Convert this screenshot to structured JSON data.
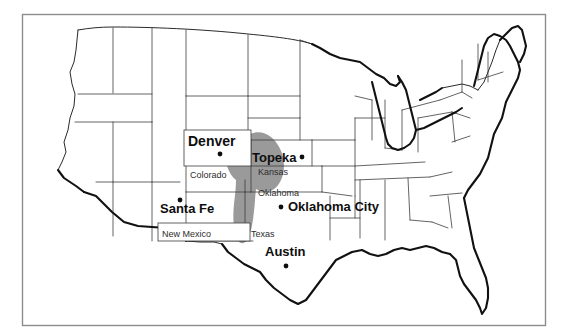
{
  "figure": {
    "name": "united-states-map",
    "background_color": "#ffffff",
    "frame_color": "#8d8d8d",
    "state_border_color": "#3c3c3c",
    "coastline_color": "#111111",
    "shaded_region_color": "#9a9a9a"
  },
  "shaded_region": {
    "label": "shaded-area",
    "color": "#9a9a9a",
    "covers": "southeastern Colorado, southwestern Kansas, Oklahoma panhandle, northern Texas panhandle"
  },
  "cities": [
    {
      "name": "Denver",
      "dot_position": "below-label"
    },
    {
      "name": "Topeka",
      "dot_position": "right-of-label"
    },
    {
      "name": "Santa Fe",
      "dot_position": "above-right-of-label"
    },
    {
      "name": "Oklahoma City",
      "dot_position": "left-of-label"
    },
    {
      "name": "Austin",
      "dot_position": "below-label"
    }
  ],
  "states": [
    {
      "name": "Colorado"
    },
    {
      "name": "Kansas"
    },
    {
      "name": "Oklahoma"
    },
    {
      "name": "New Mexico"
    },
    {
      "name": "Texas"
    }
  ]
}
